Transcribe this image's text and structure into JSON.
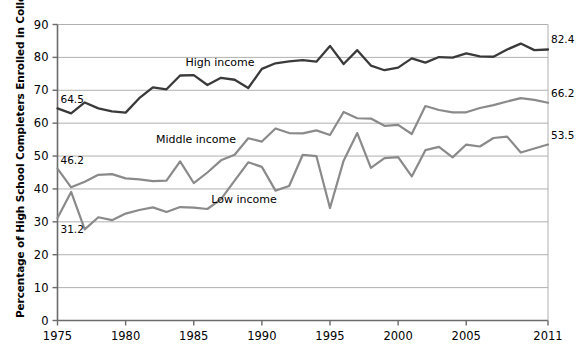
{
  "chart_data": {
    "type": "line",
    "title": "",
    "xlabel": "",
    "ylabel": "Percentage of High School Completers Enrolled in College",
    "xlim": [
      1975,
      2011
    ],
    "ylim": [
      0,
      90
    ],
    "y_ticks": [
      0,
      10,
      20,
      30,
      40,
      50,
      60,
      70,
      80,
      90
    ],
    "x_ticks": [
      1975,
      1980,
      1985,
      1990,
      1995,
      2000,
      2005,
      2011
    ],
    "grid": "horizontal",
    "legend": "inline-labels",
    "x": [
      1975,
      1976,
      1977,
      1978,
      1979,
      1980,
      1981,
      1982,
      1983,
      1984,
      1985,
      1986,
      1987,
      1988,
      1989,
      1990,
      1991,
      1992,
      1993,
      1994,
      1995,
      1996,
      1997,
      1998,
      1999,
      2000,
      2001,
      2002,
      2003,
      2004,
      2005,
      2006,
      2007,
      2008,
      2009,
      2010,
      2011
    ],
    "series": [
      {
        "name": "High income",
        "color": "#3a3a3a",
        "values": [
          64.5,
          63.0,
          66.3,
          64.5,
          63.6,
          63.2,
          67.6,
          70.9,
          70.3,
          74.5,
          74.6,
          71.6,
          73.8,
          73.2,
          70.7,
          76.5,
          78.2,
          78.8,
          79.2,
          78.7,
          83.5,
          78.0,
          82.2,
          77.5,
          76.1,
          76.9,
          79.7,
          78.4,
          80.1,
          79.9,
          81.2,
          80.3,
          80.2,
          82.4,
          84.2,
          82.2,
          82.4
        ]
      },
      {
        "name": "Middle income",
        "color": "#8a8a8a",
        "values": [
          46.2,
          40.5,
          42.2,
          44.3,
          44.5,
          43.2,
          42.9,
          42.4,
          42.5,
          48.4,
          41.8,
          45.0,
          48.7,
          50.4,
          55.4,
          54.4,
          58.4,
          57.0,
          56.9,
          57.8,
          56.4,
          63.4,
          61.5,
          61.4,
          59.2,
          59.5,
          56.7,
          65.2,
          64.0,
          63.3,
          63.3,
          64.6,
          65.5,
          66.6,
          67.6,
          67.1,
          66.2
        ]
      },
      {
        "name": "Low income",
        "color": "#8a8a8a",
        "values": [
          31.2,
          39.1,
          27.7,
          31.4,
          30.5,
          32.5,
          33.6,
          34.4,
          33.0,
          34.5,
          34.3,
          33.9,
          36.9,
          42.5,
          48.1,
          46.7,
          39.5,
          40.9,
          50.4,
          50.0,
          34.2,
          48.6,
          57.0,
          46.4,
          49.4,
          49.7,
          43.8,
          51.8,
          52.8,
          49.6,
          53.5,
          52.9,
          55.5,
          55.9,
          51.1,
          52.3,
          53.5
        ]
      }
    ],
    "endpoint_labels": [
      {
        "series": "High income",
        "year": 2011,
        "value": 82.4,
        "text": "82.4"
      },
      {
        "series": "Middle income",
        "year": 2011,
        "value": 66.2,
        "text": "66.2"
      },
      {
        "series": "Low income",
        "year": 2011,
        "value": 53.5,
        "text": "53.5"
      }
    ],
    "start_labels": [
      {
        "series": "High income",
        "year": 1975,
        "value": 64.5,
        "text": "64.5"
      },
      {
        "series": "Middle income",
        "year": 1975,
        "value": 46.2,
        "text": "46.2"
      },
      {
        "series": "Low income",
        "year": 1975,
        "value": 31.2,
        "text": "31.2"
      }
    ],
    "inline_labels": [
      {
        "text": "High income",
        "x_px": 220,
        "y_px": 62
      },
      {
        "text": "Middle income",
        "x_px": 196,
        "y_px": 139
      },
      {
        "text": "Low income",
        "x_px": 244,
        "y_px": 199
      }
    ],
    "axis_color": "#6b6b6b",
    "grid_color": "#b0b0b0"
  }
}
